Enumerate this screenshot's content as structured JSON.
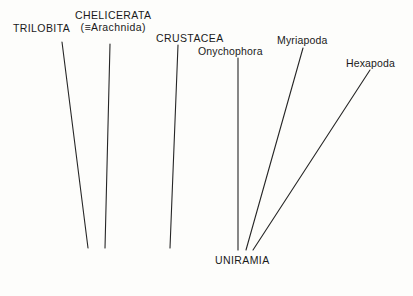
{
  "diagram": {
    "background_color": "#fdfdfb",
    "line_color": "#262626",
    "labels": {
      "trilobita": "TRILOBITA",
      "chelicerata": "CHELICERATA",
      "chelicerata_synonym": "(≡Arachnida)",
      "crustacea": "CRUSTACEA",
      "onychophora": "Onychophora",
      "myriapoda": "Myriapoda",
      "hexapoda": "Hexapoda",
      "uniramia": "UNIRAMIA"
    },
    "branches": [
      {
        "name": "trilobita-branch",
        "x1": 62,
        "y1": 42,
        "x2": 88,
        "y2": 248
      },
      {
        "name": "chelicerata-branch",
        "x1": 110,
        "y1": 44,
        "x2": 105,
        "y2": 248
      },
      {
        "name": "crustacea-branch",
        "x1": 178,
        "y1": 45,
        "x2": 170,
        "y2": 248
      },
      {
        "name": "onychophora-branch",
        "x1": 238,
        "y1": 58,
        "x2": 238,
        "y2": 250
      },
      {
        "name": "myriapoda-branch",
        "x1": 303,
        "y1": 48,
        "x2": 246,
        "y2": 250
      },
      {
        "name": "hexapoda-branch",
        "x1": 370,
        "y1": 70,
        "x2": 253,
        "y2": 250
      }
    ]
  }
}
